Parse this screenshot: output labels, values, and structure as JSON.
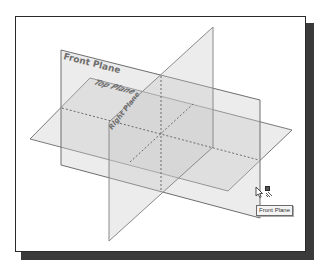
{
  "viewport": {
    "background": "#ffffff",
    "border_color": "#2a2a2a",
    "shadow_color": "#3a3a3a"
  },
  "planes": {
    "front": {
      "label": "Front Plane"
    },
    "top": {
      "label": "Top Plane"
    },
    "right": {
      "label": "Right Plane"
    }
  },
  "colors": {
    "plane_fill": "#c8c8c8",
    "plane_edge": "#7a7a7a",
    "dash": "#6a6a6a",
    "label": "#6e6e6e"
  },
  "cursor": {
    "tooltip": "Front Plane",
    "icon": "plane-select-icon"
  }
}
